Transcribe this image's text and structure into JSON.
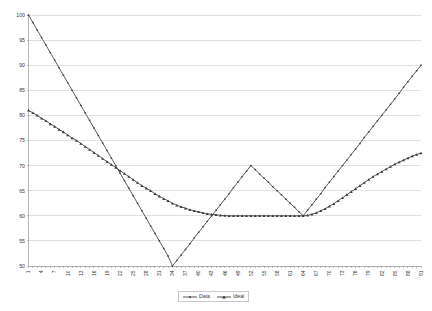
{
  "chart_data": {
    "type": "line",
    "title": "",
    "subtitle": "",
    "xlabel": "",
    "ylabel": "",
    "xlim": [
      1,
      91
    ],
    "ylim": [
      50,
      100
    ],
    "y_ticks": [
      50,
      55,
      60,
      65,
      70,
      75,
      80,
      85,
      90,
      95,
      100
    ],
    "x_ticks": [
      1,
      4,
      7,
      10,
      13,
      16,
      19,
      22,
      25,
      28,
      31,
      34,
      37,
      40,
      43,
      46,
      49,
      52,
      55,
      58,
      61,
      64,
      67,
      70,
      73,
      76,
      79,
      82,
      85,
      88,
      91
    ],
    "x_tick_labels": [
      "1",
      "4",
      "7",
      "10",
      "13",
      "16",
      "19",
      "22",
      "25",
      "28",
      "31",
      "34",
      "37",
      "40",
      "43",
      "46",
      "49",
      "52",
      "55",
      "58",
      "61",
      "64",
      "67",
      "70",
      "73",
      "76",
      "79",
      "82",
      "85",
      "88",
      "91"
    ],
    "y_tick_labels": [
      "50",
      "55",
      "60",
      "65",
      "70",
      "75",
      "80",
      "85",
      "90",
      "95",
      "100"
    ],
    "grid": "horizontal",
    "legend_position": "bottom-center",
    "x": [
      1,
      2,
      3,
      4,
      5,
      6,
      7,
      8,
      9,
      10,
      11,
      12,
      13,
      14,
      15,
      16,
      17,
      18,
      19,
      20,
      21,
      22,
      23,
      24,
      25,
      26,
      27,
      28,
      29,
      30,
      31,
      32,
      33,
      34,
      35,
      36,
      37,
      38,
      39,
      40,
      41,
      42,
      43,
      44,
      45,
      46,
      47,
      48,
      49,
      50,
      51,
      52,
      53,
      54,
      55,
      56,
      57,
      58,
      59,
      60,
      61,
      62,
      63,
      64,
      65,
      66,
      67,
      68,
      69,
      70,
      71,
      72,
      73,
      74,
      75,
      76,
      77,
      78,
      79,
      80,
      81,
      82,
      83,
      84,
      85,
      86,
      87,
      88,
      89,
      90,
      91
    ],
    "series": [
      {
        "name": "Data",
        "color": "#404040",
        "marker": "small-square",
        "values": [
          100,
          98.5,
          97,
          95.5,
          94,
          92.5,
          91,
          89.5,
          88,
          86.5,
          85,
          83.5,
          82,
          80.5,
          79,
          77.5,
          76,
          74.5,
          73,
          71.5,
          70,
          68.5,
          67,
          65.5,
          64,
          62.5,
          61,
          59.5,
          58,
          56.5,
          55,
          53.5,
          52,
          50,
          51.1,
          52.2,
          53.3,
          54.4,
          55.6,
          56.7,
          57.8,
          58.9,
          60,
          61.1,
          62.2,
          63.3,
          64.4,
          65.6,
          66.7,
          67.8,
          68.9,
          70,
          69.2,
          68.3,
          67.5,
          66.7,
          65.8,
          65,
          64.2,
          63.3,
          62.5,
          61.7,
          60.8,
          60,
          61.1,
          62.2,
          63.3,
          64.4,
          65.6,
          66.7,
          67.8,
          68.9,
          70,
          71.1,
          72.2,
          73.3,
          74.4,
          75.6,
          76.7,
          77.8,
          78.9,
          80,
          81.1,
          82.2,
          83.3,
          84.4,
          85.6,
          86.7,
          87.8,
          88.9,
          90
        ]
      },
      {
        "name": "Ideal",
        "color": "#3a3a3a",
        "marker": "triangle",
        "values": [
          81,
          80.5,
          80,
          79.4,
          78.9,
          78.3,
          77.8,
          77.2,
          76.7,
          76.1,
          75.5,
          75,
          74.4,
          73.8,
          73.2,
          72.6,
          72,
          71.4,
          70.8,
          70.2,
          69.6,
          69,
          68.4,
          67.8,
          67.2,
          66.6,
          66,
          65.5,
          65,
          64.4,
          63.9,
          63.4,
          63,
          62.5,
          62.1,
          61.8,
          61.5,
          61.2,
          61,
          60.8,
          60.6,
          60.4,
          60.3,
          60.2,
          60.1,
          60.05,
          60,
          60,
          60,
          60,
          60,
          60,
          60,
          60,
          60,
          60,
          60,
          60,
          60,
          60,
          60,
          60,
          60,
          60,
          60.1,
          60.3,
          60.6,
          61,
          61.4,
          61.9,
          62.4,
          63,
          63.6,
          64.2,
          64.8,
          65.4,
          66,
          66.6,
          67.2,
          67.8,
          68.3,
          68.8,
          69.3,
          69.8,
          70.3,
          70.7,
          71.1,
          71.5,
          71.9,
          72.2,
          72.5
        ]
      }
    ],
    "legend": [
      {
        "label": "Data",
        "color": "#404040",
        "marker": "small-square"
      },
      {
        "label": "Ideal",
        "color": "#3a3a3a",
        "marker": "triangle"
      }
    ]
  }
}
